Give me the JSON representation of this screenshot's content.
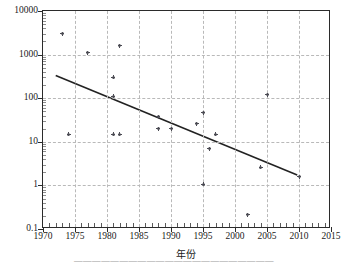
{
  "figure": {
    "background_color": "#ffffff",
    "frame_color": "#2b2b2b",
    "grid_color": "#b9b9b9",
    "marker_color": "#55555d",
    "trend_color": "#222222",
    "caption_partial": "——————————————————————"
  },
  "chart_data": {
    "type": "scatter",
    "title": "",
    "xlabel": "年份",
    "ylabel": "甲烷抽采量(10¹²m³)",
    "ylabel_text": "甲烷抽采量(10",
    "ylabel_exponent": "12",
    "ylabel_suffix": "m3)",
    "xlim": [
      1970,
      2015
    ],
    "ylim": [
      0.1,
      10000
    ],
    "yscale": "log",
    "xscale": "linear",
    "grid": true,
    "legend": "none",
    "xticks": [
      1970,
      1975,
      1980,
      1985,
      1990,
      1995,
      2000,
      2005,
      2010,
      2015
    ],
    "xticklabels": [
      "1970",
      "1975",
      "1980",
      "1985",
      "1990",
      "1995",
      "2000",
      "2005",
      "2010",
      "2015"
    ],
    "yticks": [
      0.1,
      1,
      10,
      100,
      1000,
      10000
    ],
    "yticklabels": [
      "0.1",
      "1",
      "10",
      "100",
      "1000",
      "10000"
    ],
    "points": [
      {
        "x": 1973,
        "y": 3000
      },
      {
        "x": 1974,
        "y": 15
      },
      {
        "x": 1977,
        "y": 1100
      },
      {
        "x": 1981,
        "y": 300
      },
      {
        "x": 1981,
        "y": 110
      },
      {
        "x": 1981,
        "y": 15
      },
      {
        "x": 1982,
        "y": 1600
      },
      {
        "x": 1982,
        "y": 15
      },
      {
        "x": 1988,
        "y": 38
      },
      {
        "x": 1988,
        "y": 20
      },
      {
        "x": 1990,
        "y": 20
      },
      {
        "x": 1994,
        "y": 26
      },
      {
        "x": 1995,
        "y": 46
      },
      {
        "x": 1995,
        "y": 1.05
      },
      {
        "x": 1996,
        "y": 7
      },
      {
        "x": 1997,
        "y": 15
      },
      {
        "x": 2002,
        "y": 0.21
      },
      {
        "x": 2004,
        "y": 2.6
      },
      {
        "x": 2005,
        "y": 120
      },
      {
        "x": 2010,
        "y": 1.6
      }
    ],
    "trendline": {
      "type": "log-linear-fit",
      "x_start": 1972,
      "y_start": 320,
      "x_end": 2010,
      "y_end": 1.6
    },
    "minor_tick_decades": [
      0.1,
      1,
      10,
      100,
      1000
    ],
    "minor_tick_multipliers": [
      2,
      3,
      4,
      5,
      6,
      7,
      8,
      9
    ]
  }
}
